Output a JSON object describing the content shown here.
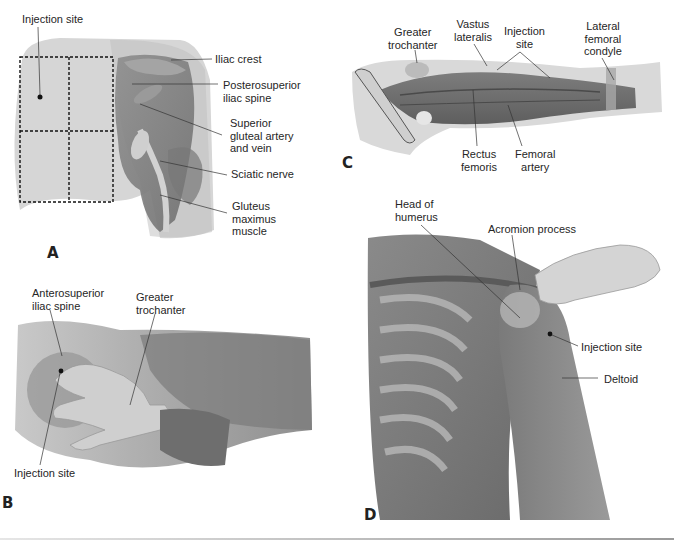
{
  "figure": {
    "panels": [
      {
        "id": "A",
        "letter": "A",
        "view": "Posterior hip (dorsogluteal site)",
        "labels": {
          "injection_site": "Injection site",
          "iliac_crest": "Iliac crest",
          "posterosuperior_iliac_spine": "Posterosuperior\niliac spine",
          "superior_gluteal_artery": "Superior\ngluteal artery\nand vein",
          "sciatic_nerve": "Sciatic nerve",
          "gluteus_maximus": "Gluteus\nmaximus\nmuscle"
        }
      },
      {
        "id": "B",
        "letter": "B",
        "view": "Lateral hip (ventrogluteal site)",
        "labels": {
          "anterosuperior_iliac_spine": "Anterosuperior\niliac spine",
          "greater_trochanter": "Greater\ntrochanter",
          "injection_site": "Injection site"
        }
      },
      {
        "id": "C",
        "letter": "C",
        "view": "Thigh (vastus lateralis site)",
        "labels": {
          "greater_trochanter": "Greater\ntrochanter",
          "vastus_lateralis": "Vastus\nlateralis",
          "injection_site": "Injection\nsite",
          "lateral_femoral_condyle": "Lateral\nfemoral\ncondyle",
          "rectus_femoris": "Rectus\nfemoris",
          "femoral_artery": "Femoral\nartery"
        }
      },
      {
        "id": "D",
        "letter": "D",
        "view": "Shoulder (deltoid site)",
        "labels": {
          "head_of_humerus": "Head of\nhumerus",
          "acromion_process": "Acromion process",
          "injection_site": "Injection site",
          "deltoid": "Deltoid"
        }
      }
    ]
  }
}
